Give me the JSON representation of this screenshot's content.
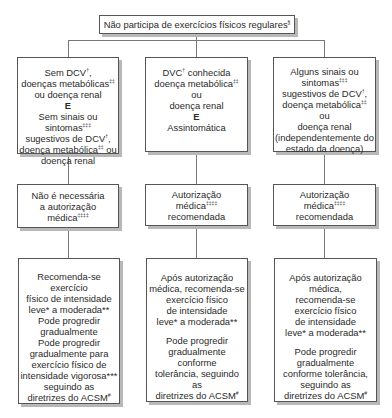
{
  "top": {
    "text": "Não participa de exercícios físicos regulares",
    "sup": "§"
  },
  "conditions": [
    {
      "lines": [
        {
          "t": "Sem DCV",
          "sup": "†",
          "after": ","
        },
        {
          "t": "doenças metabólicas",
          "sup": "‡‡"
        },
        {
          "t": "ou doença renal"
        },
        {
          "t": "E",
          "bold": true
        },
        {
          "t": "Sem sinais ou"
        },
        {
          "t": "sintomas",
          "sup": "‡‡‡"
        },
        {
          "t": "sugestivos de DCV",
          "sup": "†",
          "after": ","
        },
        {
          "t": "doença metabólica",
          "sup": "‡‡",
          "after": " ou"
        },
        {
          "t": "doença renal"
        }
      ]
    },
    {
      "lines": [
        {
          "t": "DVC",
          "sup": "†",
          "after": " conhecida"
        },
        {
          "t": "doença metabólica",
          "sup": "‡‡"
        },
        {
          "t": "ou"
        },
        {
          "t": "doença renal"
        },
        {
          "t": "E",
          "bold": true
        },
        {
          "t": "Assintomática"
        }
      ]
    },
    {
      "lines": [
        {
          "t": "Alguns sinais ou"
        },
        {
          "t": "sintomas",
          "sup": "‡‡‡"
        },
        {
          "t": "sugestivos de DCV",
          "sup": "†",
          "after": ","
        },
        {
          "t": "doença metabólica",
          "sup": "‡‡"
        },
        {
          "t": "ou"
        },
        {
          "t": "doença renal"
        },
        {
          "gap": true
        },
        {
          "t": "(independentemente do"
        },
        {
          "t": "estado da doença)"
        }
      ]
    }
  ],
  "authorization": [
    {
      "lines": [
        {
          "t": "Não é necessária"
        },
        {
          "t": "a autorização"
        },
        {
          "t": "médica",
          "sup": "‡‡‡‡"
        }
      ]
    },
    {
      "lines": [
        {
          "t": "Autorização"
        },
        {
          "t": "médica",
          "sup": "‡‡‡‡"
        },
        {
          "t": "recomendada"
        }
      ]
    },
    {
      "lines": [
        {
          "t": "Autorização"
        },
        {
          "t": "médica",
          "sup": "‡‡‡‡"
        },
        {
          "t": "recomendada"
        }
      ]
    }
  ],
  "recommendations": [
    {
      "lines": [
        {
          "t": "Recomenda-se"
        },
        {
          "t": "exercício"
        },
        {
          "t": "físico de intensidade"
        },
        {
          "t": "leve* a moderada**"
        },
        {
          "t": "Pode progredir"
        },
        {
          "t": "gradualmente"
        },
        {
          "gap": true
        },
        {
          "t": "Pode progredir"
        },
        {
          "t": "gradualmente para"
        },
        {
          "t": "exercício físico de"
        },
        {
          "t": "intensidade vigorosa***"
        },
        {
          "t": "seguindo as"
        },
        {
          "t": "diretrizes do ACSM",
          "sup": "#"
        }
      ]
    },
    {
      "lines": [
        {
          "t": "Após autorização"
        },
        {
          "t": "médica, recomenda-se"
        },
        {
          "t": "exercício físico"
        },
        {
          "t": "de intensidade"
        },
        {
          "t": "leve* a moderada**"
        },
        {
          "gap": true
        },
        {
          "t": "Pode progredir"
        },
        {
          "t": "gradualmente"
        },
        {
          "t": "conforme"
        },
        {
          "t": "tolerância, seguindo"
        },
        {
          "t": "as"
        },
        {
          "t": "diretrizes do ACSM",
          "sup": "#"
        }
      ]
    },
    {
      "lines": [
        {
          "t": "Após autorização"
        },
        {
          "t": "médica,"
        },
        {
          "t": "recomenda-se"
        },
        {
          "t": "exercício físico"
        },
        {
          "t": "de intensidade"
        },
        {
          "t": "leve* a moderada**"
        },
        {
          "gap": true
        },
        {
          "t": "Pode progredir"
        },
        {
          "t": "gradualmente"
        },
        {
          "t": "conforme tolerância,"
        },
        {
          "t": "seguindo as"
        },
        {
          "t": "diretrizes do ACSM",
          "sup": "#"
        }
      ]
    }
  ]
}
